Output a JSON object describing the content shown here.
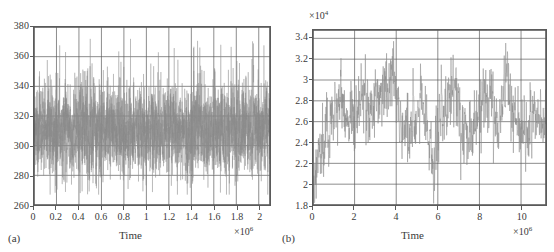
{
  "figure": {
    "background": "#ffffff",
    "trace_color": "#8a8a8a",
    "axis_color": "#5a5a5a",
    "grid_color": "#5a5a5a"
  },
  "panels": [
    {
      "id": "a",
      "label": "(a)",
      "xlabel": "Time",
      "x_exponent_prefix": "×10",
      "x_exponent": "6",
      "y_exponent_prefix": "",
      "y_exponent": "",
      "xticks": [
        "0",
        "0.2",
        "0.4",
        "0.6",
        "0.8",
        "1",
        "1.2",
        "1.4",
        "1.6",
        "1.8",
        "2"
      ],
      "yticks": [
        "260",
        "280",
        "300",
        "320",
        "340",
        "360",
        "380"
      ]
    },
    {
      "id": "b",
      "label": "(b)",
      "xlabel": "Time",
      "x_exponent_prefix": "×10",
      "x_exponent": "6",
      "y_exponent_prefix": "×10",
      "y_exponent": "4",
      "xticks": [
        "0",
        "2",
        "4",
        "6",
        "8",
        "10"
      ],
      "yticks": [
        "1.8",
        "2",
        "2.2",
        "2.4",
        "2.6",
        "2.8",
        "3",
        "3.2",
        "3.4"
      ]
    }
  ],
  "chart_data": [
    {
      "type": "line",
      "panel": "a",
      "title": "",
      "xlabel": "Time",
      "ylabel": "",
      "x_scale_factor": 1000000,
      "x_scale_label": "×10^6",
      "y_scale_factor": 1,
      "xlim": [
        0,
        2100000
      ],
      "ylim": [
        260,
        380
      ],
      "xticks": [
        0,
        200000,
        400000,
        600000,
        800000,
        1000000,
        1200000,
        1400000,
        1600000,
        1800000,
        2000000
      ],
      "xtick_labels": [
        "0",
        "0.2",
        "0.4",
        "0.6",
        "0.8",
        "1",
        "1.2",
        "1.4",
        "1.6",
        "1.8",
        "2"
      ],
      "yticks": [
        260,
        280,
        300,
        320,
        340,
        360,
        380
      ],
      "ytick_labels": [
        "260",
        "280",
        "300",
        "320",
        "340",
        "360",
        "380"
      ],
      "grid": true,
      "grid_x_at": [
        200000,
        400000,
        600000,
        800000,
        1000000,
        1200000,
        1400000,
        1600000,
        1800000,
        2000000
      ],
      "grid_y_at": [
        280,
        300,
        320,
        340,
        360
      ],
      "legend": null,
      "description": "Dense high-frequency noisy time series, stationary about a mean of roughly 311 with most values between 280 and 340 and occasional spikes to 370 and dips to 268.",
      "series": [
        {
          "name": "trace",
          "mean": 311,
          "band_low": 283,
          "band_high": 340,
          "min": 267,
          "max": 372,
          "noise_sigma": 14,
          "n_points": 4200,
          "color": "#8a8a8a"
        }
      ]
    },
    {
      "type": "line",
      "panel": "b",
      "title": "",
      "xlabel": "Time",
      "ylabel": "",
      "x_scale_factor": 1000000,
      "x_scale_label": "×10^6",
      "y_scale_factor": 10000,
      "y_scale_label": "×10^4",
      "xlim": [
        0,
        11200000
      ],
      "ylim": [
        18000,
        34800
      ],
      "xticks": [
        0,
        2000000,
        4000000,
        6000000,
        8000000,
        10000000
      ],
      "xtick_labels": [
        "0",
        "2",
        "4",
        "6",
        "8",
        "10"
      ],
      "yticks": [
        18000,
        20000,
        22000,
        24000,
        26000,
        28000,
        30000,
        32000,
        34000
      ],
      "ytick_labels": [
        "1.8",
        "2",
        "2.2",
        "2.4",
        "2.6",
        "2.8",
        "3",
        "3.2",
        "3.4"
      ],
      "grid": true,
      "grid_x_at": [
        2000000,
        4000000,
        6000000,
        8000000,
        10000000
      ],
      "grid_y_at": [
        20000,
        22000,
        24000,
        26000,
        28000,
        30000,
        32000,
        34000
      ],
      "legend": null,
      "description": "Noisy time series rising sharply from about 18500 near t=0 to a fluctuating plateau around 26000-28000, with excursions up to 33000 near t=3.8e6 and t=6.8e6 and dips to about 20000 near t=5.8e6.",
      "series": [
        {
          "name": "trace",
          "color": "#8a8a8a",
          "n_points": 1100,
          "noise_sigma": 1500,
          "x_knots": [
            0,
            150000,
            400000,
            700000,
            1100000,
            1500000,
            2000000,
            2400000,
            2900000,
            3300000,
            3800000,
            4200000,
            4700000,
            5100000,
            5500000,
            5800000,
            6100000,
            6500000,
            6800000,
            7200000,
            7700000,
            8100000,
            8500000,
            8900000,
            9300000,
            9700000,
            10100000,
            10500000,
            11000000
          ],
          "y_knots": [
            18600,
            21500,
            23800,
            24800,
            27200,
            27000,
            26200,
            28000,
            27000,
            28800,
            30500,
            26600,
            24600,
            29000,
            25500,
            21800,
            27000,
            27500,
            30000,
            26000,
            24800,
            27500,
            29200,
            25000,
            30500,
            26200,
            25000,
            26200,
            26500
          ]
        }
      ]
    }
  ]
}
